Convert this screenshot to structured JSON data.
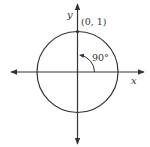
{
  "diagram": {
    "type": "unit-circle",
    "axes": {
      "x_label": "x",
      "y_label": "y"
    },
    "point": {
      "label": "(0, 1)",
      "coords": [
        0,
        1
      ]
    },
    "angle": {
      "label": "90°",
      "degrees": 90
    },
    "colors": {
      "stroke": "#333333",
      "background": "#ffffff"
    }
  }
}
